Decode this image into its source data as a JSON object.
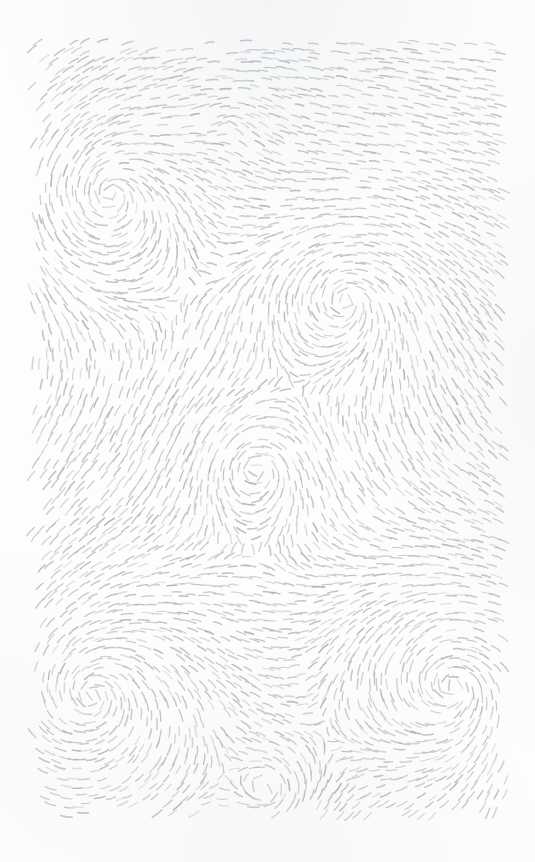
{
  "artwork": {
    "title": "Flow Field Dash Pattern",
    "medium": "generative vector field, short dash strokes",
    "canvas": {
      "width": 535,
      "height": 862
    },
    "background_color": "#fdfdfd",
    "margin": {
      "left": 32,
      "top": 42,
      "right": 30,
      "bottom": 47
    },
    "plot_area": {
      "x": 32,
      "y": 42,
      "width": 473,
      "height": 773
    }
  },
  "stroke_style": {
    "color": "#b4b8bd",
    "color_light": "#c8ccd0",
    "color_dark": "#a6abb0",
    "opacity": 0.85,
    "width": 1.35,
    "linecap": "round",
    "dash_length_min": 7,
    "dash_length_max": 15,
    "dash_length_mean": 11
  },
  "field": {
    "type": "vortex-superposition",
    "grid_spacing": 9.2,
    "jitter": 2.4,
    "base_flow_angle_deg": 6,
    "base_flow_strength": 0.3,
    "noise_scale": 0.0085,
    "noise_strength": 0.62,
    "singularities": [
      {
        "name": "vortex-top-left",
        "cx": 110,
        "cy": 192,
        "strength": 1.0,
        "radius": 300,
        "sense": "ccw"
      },
      {
        "name": "vortex-top-right",
        "cx": 348,
        "cy": 300,
        "strength": 0.92,
        "radius": 280,
        "sense": "ccw"
      },
      {
        "name": "vortex-bottom-left",
        "cx": 92,
        "cy": 695,
        "strength": 1.05,
        "radius": 300,
        "sense": "ccw"
      },
      {
        "name": "vortex-bottom-right",
        "cx": 452,
        "cy": 686,
        "strength": 0.95,
        "radius": 280,
        "sense": "ccw"
      },
      {
        "name": "saddle-center",
        "cx": 255,
        "cy": 470,
        "strength": -0.42,
        "radius": 260,
        "sense": "cw"
      },
      {
        "name": "saddle-upper-mid",
        "cx": 232,
        "cy": 120,
        "strength": -0.28,
        "radius": 200,
        "sense": "cw"
      },
      {
        "name": "saddle-lower-mid",
        "cx": 268,
        "cy": 790,
        "strength": -0.26,
        "radius": 200,
        "sense": "cw"
      }
    ]
  },
  "chart_data": {
    "type": "scatter",
    "title": "Flow Field Dash Pattern",
    "xlabel": "",
    "ylabel": "",
    "xlim": [
      32,
      505
    ],
    "ylim": [
      42,
      815
    ],
    "grid": false,
    "legend": null,
    "annotations": [],
    "series": [
      {
        "name": "dash-strokes",
        "description": "Short line segments oriented tangent to a superposed vortex field",
        "approx_count": 4200,
        "color": "#b4b8bd",
        "values": []
      }
    ]
  }
}
